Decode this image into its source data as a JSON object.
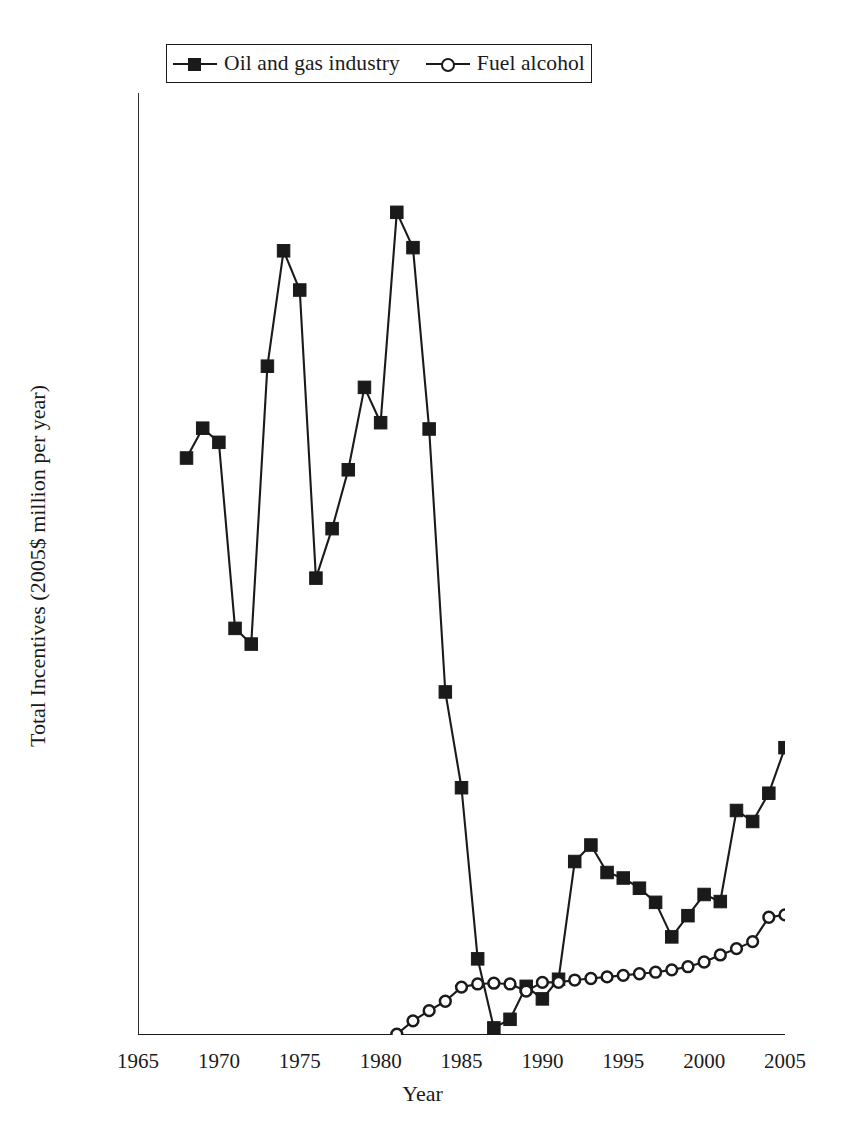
{
  "chart_data": {
    "type": "line",
    "title": "",
    "xlabel": "Year",
    "ylabel": "Total Incentives (2005$ million per year)",
    "xlim": [
      1965,
      2005
    ],
    "ylim": [
      0,
      12000
    ],
    "xticks": [
      1965,
      1970,
      1975,
      1980,
      1985,
      1990,
      1995,
      2000,
      2005
    ],
    "yticks": [
      0,
      2000,
      4000,
      6000,
      8000,
      10000,
      12000
    ],
    "grid": false,
    "legend_position": "top-center",
    "series": [
      {
        "name": "Oil and gas industry",
        "marker": "filled-square",
        "color": "#1a1a1a",
        "x": [
          1968,
          1969,
          1970,
          1971,
          1972,
          1973,
          1974,
          1975,
          1976,
          1977,
          1978,
          1979,
          1980,
          1981,
          1982,
          1983,
          1984,
          1985,
          1986,
          1987,
          1988,
          1989,
          1990,
          1991,
          1992,
          1993,
          1994,
          1995,
          1996,
          1997,
          1998,
          1999,
          2000,
          2001,
          2002,
          2003,
          2004,
          2005
        ],
        "values": [
          7350,
          7730,
          7550,
          5180,
          4980,
          8520,
          9990,
          9490,
          5820,
          6450,
          7200,
          8250,
          7800,
          10480,
          10030,
          7720,
          4370,
          3150,
          970,
          90,
          200,
          620,
          460,
          710,
          2210,
          2420,
          2070,
          2000,
          1870,
          1690,
          1250,
          1520,
          1790,
          1700,
          2860,
          2720,
          3080,
          3660
        ]
      },
      {
        "name": "Fuel alcohol",
        "marker": "open-circle",
        "color": "#1a1a1a",
        "x": [
          1981,
          1982,
          1983,
          1984,
          1985,
          1986,
          1987,
          1988,
          1989,
          1990,
          1991,
          1992,
          1993,
          1994,
          1995,
          1996,
          1997,
          1998,
          1999,
          2000,
          2001,
          2002,
          2003,
          2004,
          2005
        ],
        "values": [
          10,
          180,
          310,
          430,
          610,
          650,
          660,
          650,
          560,
          670,
          670,
          700,
          720,
          740,
          760,
          780,
          800,
          830,
          870,
          930,
          1020,
          1100,
          1190,
          1500,
          1530
        ]
      }
    ]
  },
  "legend": {
    "entries": [
      {
        "label": "Oil and gas industry",
        "marker": "filled-square"
      },
      {
        "label": "Fuel alcohol",
        "marker": "open-circle"
      }
    ]
  },
  "axes": {
    "x_title": "Year",
    "y_title": "Total Incentives (2005$ million per year)",
    "x_tick_labels": [
      "1965",
      "1970",
      "1975",
      "1980",
      "1985",
      "1990",
      "1995",
      "2000",
      "2005"
    ],
    "y_tick_labels": [
      "0",
      "2000",
      "4000",
      "6000",
      "8000",
      "10000",
      "12000"
    ]
  },
  "colors": {
    "ink": "#1a1a1a",
    "background": "#ffffff"
  }
}
